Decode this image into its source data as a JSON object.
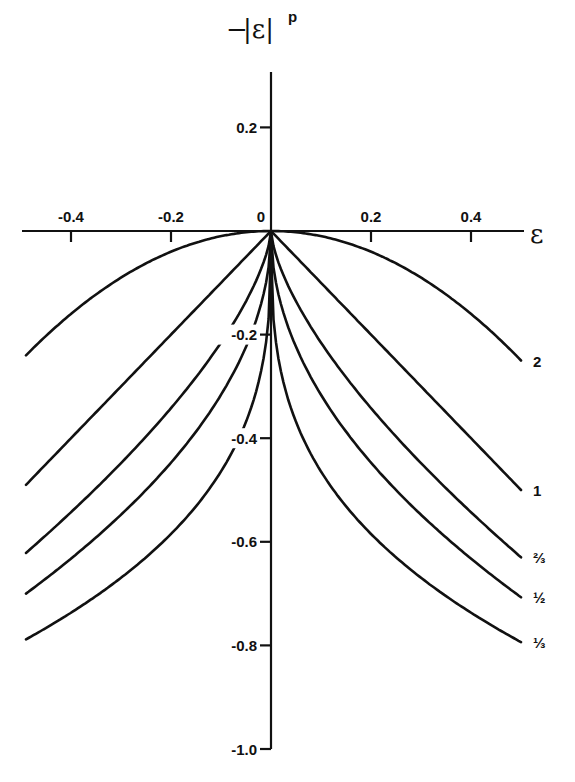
{
  "chart_data": {
    "type": "line",
    "title": "",
    "ylabel": "-|ε|^p",
    "xlabel": "ε",
    "xlim": [
      -0.49,
      0.5
    ],
    "ylim": [
      -1.0,
      0.3
    ],
    "grid": false,
    "legend": "inline labels at right end of each curve",
    "x_ticks": [
      {
        "value": -0.4,
        "label": "-0.4"
      },
      {
        "value": -0.2,
        "label": "-0.2"
      },
      {
        "value": 0,
        "label": "0"
      },
      {
        "value": 0.2,
        "label": "0.2"
      },
      {
        "value": 0.4,
        "label": "0.4"
      }
    ],
    "y_ticks": [
      {
        "value": 0.2,
        "label": "0.2"
      },
      {
        "value": -0.2,
        "label": "-0.2"
      },
      {
        "value": -0.4,
        "label": "-0.4"
      },
      {
        "value": -0.6,
        "label": "-0.6"
      },
      {
        "value": -0.8,
        "label": "-0.8"
      },
      {
        "value": -1.0,
        "label": "-1.0"
      }
    ],
    "function": "y = -|ε|^p",
    "series": [
      {
        "name": "2",
        "p": 2,
        "label": "2",
        "y_at_0.5": -0.25
      },
      {
        "name": "1",
        "p": 1,
        "label": "1",
        "y_at_0.5": -0.5
      },
      {
        "name": "2/3",
        "p": 0.6667,
        "label": "⅔",
        "y_at_0.5": -0.63
      },
      {
        "name": "1/2",
        "p": 0.5,
        "label": "½",
        "y_at_0.5": -0.707
      },
      {
        "name": "1/3",
        "p": 0.3333,
        "label": "⅓",
        "y_at_0.5": -0.794
      }
    ]
  },
  "axes": {
    "y_title_prefix": "−",
    "y_title_body": "|ε|",
    "y_title_sup": "p",
    "x_title": "ε"
  }
}
